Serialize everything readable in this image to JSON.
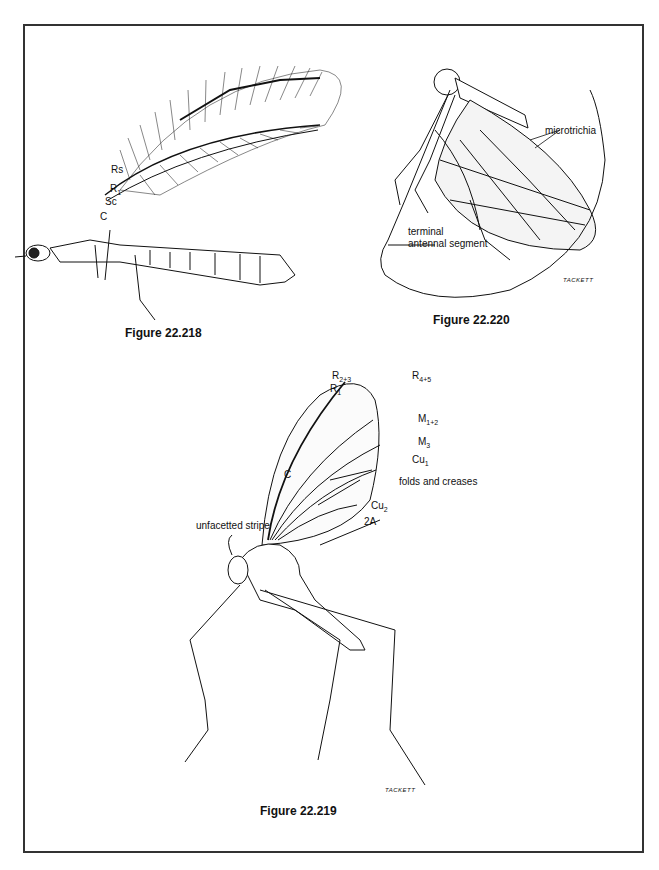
{
  "figures": [
    {
      "caption": "Figure 22.218",
      "labels": {
        "rs": "Rs",
        "r1": "R",
        "r1_sub": "1",
        "sc": "Sc",
        "c": "C"
      }
    },
    {
      "caption": "Figure 22.220",
      "labels": {
        "microtrichia": "microtrichia",
        "terminal_1": "terminal",
        "terminal_2": "antennal segment"
      },
      "signature": "TACKETT"
    },
    {
      "caption": "Figure 22.219",
      "labels": {
        "r1": "R",
        "r1_sub": "1",
        "r23": "R",
        "r23_sub": "2+3",
        "r45": "R",
        "r45_sub": "4+5",
        "m12": "M",
        "m12_sub": "1+2",
        "m3": "M",
        "m3_sub": "3",
        "cu1": "Cu",
        "cu1_sub": "1",
        "folds": "folds and creases",
        "cu2": "Cu",
        "cu2_sub": "2",
        "a2": "2A",
        "c": "C",
        "unfacetted": "unfacetted stripe"
      },
      "signature": "TACKETT"
    }
  ]
}
